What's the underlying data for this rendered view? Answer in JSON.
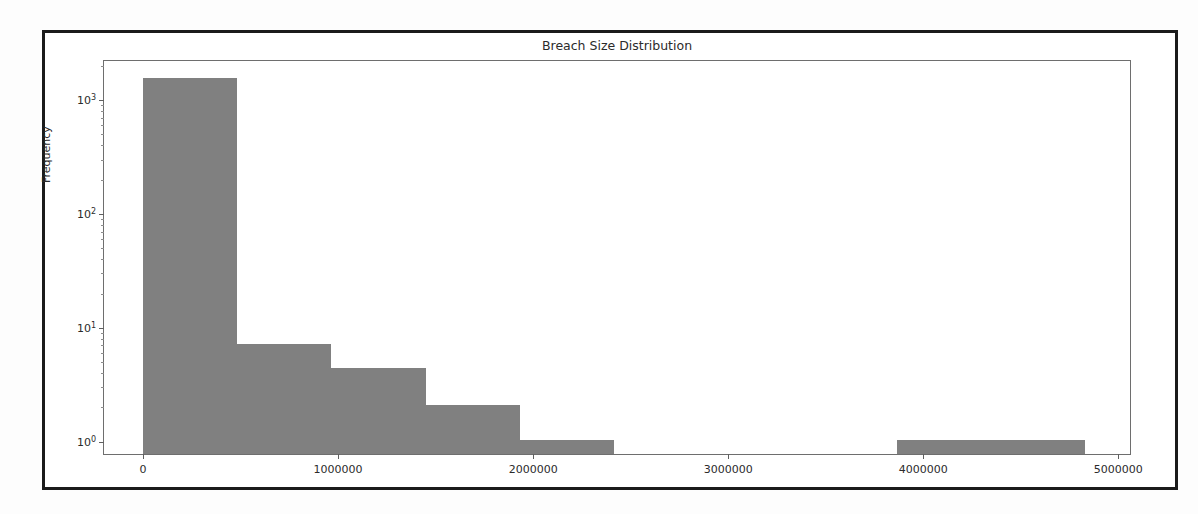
{
  "figure": {
    "background_color": "#ffffff",
    "border_color": "#1b1b1b",
    "bar_color": "#808080",
    "axes_edge_color": "#6e6e6e"
  },
  "chart_data": {
    "type": "bar",
    "title": "Breach Size Distribution",
    "xlabel": "",
    "ylabel": "Frequency",
    "yscale": "log",
    "grid": false,
    "legend": null,
    "xlim": [
      -200000,
      5070000
    ],
    "ylim": [
      0.75,
      2200
    ],
    "xticks": [
      0,
      1000000,
      2000000,
      3000000,
      4000000,
      5000000
    ],
    "xtick_labels": [
      "0",
      "1000000",
      "2000000",
      "3000000",
      "4000000",
      "5000000"
    ],
    "yticks": [
      1,
      10,
      100,
      1000
    ],
    "ytick_labels": [
      "10⁰",
      "10¹",
      "10²",
      "10³"
    ],
    "ytick_mantissas": [
      "0",
      "1",
      "2",
      "3"
    ],
    "bin_width": 483000,
    "bins": [
      {
        "x0": 0,
        "x1": 483000,
        "value": 1500
      },
      {
        "x0": 483000,
        "x1": 966000,
        "value": 7
      },
      {
        "x0": 966000,
        "x1": 1449000,
        "value": 4.3
      },
      {
        "x0": 1449000,
        "x1": 1932000,
        "value": 2
      },
      {
        "x0": 1932000,
        "x1": 2415000,
        "value": 1
      },
      {
        "x0": 2415000,
        "x1": 2898000,
        "value": 0
      },
      {
        "x0": 2898000,
        "x1": 3381000,
        "value": 0
      },
      {
        "x0": 3381000,
        "x1": 3864000,
        "value": 0
      },
      {
        "x0": 3864000,
        "x1": 4347000,
        "value": 1
      },
      {
        "x0": 4347000,
        "x1": 4830000,
        "value": 1
      }
    ],
    "categories": [
      "0–483k",
      "483k–966k",
      "966k–1.45M",
      "1.45M–1.93M",
      "1.93M–2.42M",
      "2.42M–2.90M",
      "2.90M–3.38M",
      "3.38M–3.86M",
      "3.86M–4.35M",
      "4.35M–4.83M"
    ],
    "values": [
      1500,
      7,
      4.3,
      2,
      1,
      0,
      0,
      0,
      1,
      1
    ]
  },
  "ghost_text": {
    "line1": "",
    "line2": ""
  }
}
